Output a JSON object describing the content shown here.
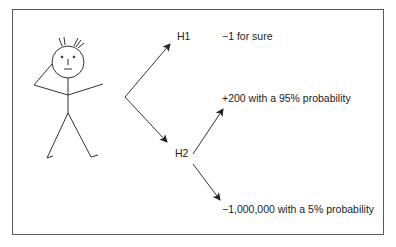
{
  "diagram": {
    "type": "decision-tree",
    "figure": "stick-figure-thinking",
    "nodes": [
      {
        "id": "H1",
        "label": "H1",
        "outcome": "−1 for sure"
      },
      {
        "id": "H2",
        "label": "H2",
        "outcomes": [
          "+200 with a 95% probability",
          "−1,000,000 with a 5% probability"
        ]
      }
    ],
    "colors": {
      "line": "#333333",
      "frame": "#5a5a5a",
      "text": "#222222"
    }
  }
}
